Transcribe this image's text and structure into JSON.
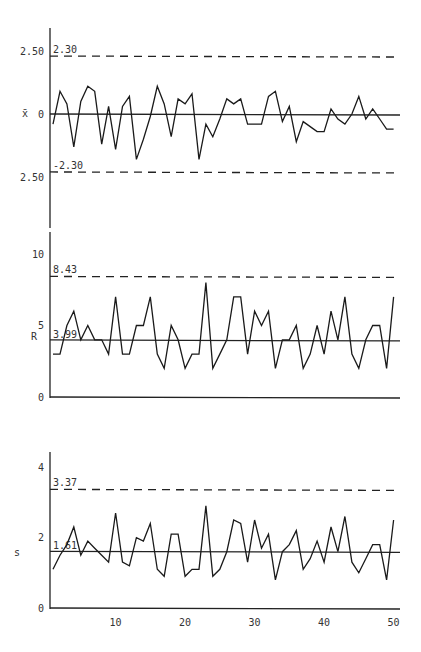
{
  "chart_data": [
    {
      "type": "line",
      "title": "",
      "ylabel": "x̄",
      "xlabel": "",
      "ytick_labels": [
        "2.50",
        "0",
        "2.50"
      ],
      "yticks": [
        2.5,
        0,
        -2.5
      ],
      "ylim": [
        -2.9,
        3.2
      ],
      "control_limits": {
        "ucl": 2.3,
        "center": 0,
        "lcl": -2.3
      },
      "ucl_label": "2.30",
      "lcl_label": "-2.30",
      "x": [
        1,
        2,
        3,
        4,
        5,
        6,
        7,
        8,
        9,
        10,
        11,
        12,
        13,
        14,
        15,
        16,
        17,
        18,
        19,
        20,
        21,
        22,
        23,
        24,
        25,
        26,
        27,
        28,
        29,
        30,
        31,
        32,
        33,
        34,
        35,
        36,
        37,
        38,
        39,
        40,
        41,
        42,
        43,
        44,
        45,
        46,
        47,
        48,
        49,
        50
      ],
      "values": [
        -0.4,
        0.9,
        0.4,
        -1.3,
        0.5,
        1.1,
        0.9,
        -1.2,
        0.3,
        -1.4,
        0.3,
        0.7,
        -1.8,
        -1.0,
        -0.1,
        1.1,
        0.4,
        -0.9,
        0.6,
        0.4,
        0.8,
        -1.8,
        -0.4,
        -0.9,
        -0.2,
        0.6,
        0.4,
        0.6,
        -0.4,
        -0.4,
        -0.4,
        0.7,
        0.9,
        -0.3,
        0.3,
        -1.1,
        -0.3,
        -0.5,
        -0.7,
        -0.7,
        0.2,
        -0.2,
        -0.4,
        0.0,
        0.7,
        -0.2,
        0.2,
        -0.2,
        -0.6,
        -0.6
      ],
      "grid": false
    },
    {
      "type": "line",
      "title": "",
      "ylabel": "R",
      "xlabel": "",
      "ytick_labels": [
        "10",
        "5",
        "0"
      ],
      "yticks": [
        10,
        5,
        0
      ],
      "ylim": [
        0,
        11
      ],
      "control_limits": {
        "ucl": 8.43,
        "center": 3.99
      },
      "ucl_label": "8.43",
      "center_label": "3.99",
      "x": [
        1,
        2,
        3,
        4,
        5,
        6,
        7,
        8,
        9,
        10,
        11,
        12,
        13,
        14,
        15,
        16,
        17,
        18,
        19,
        20,
        21,
        22,
        23,
        24,
        25,
        26,
        27,
        28,
        29,
        30,
        31,
        32,
        33,
        34,
        35,
        36,
        37,
        38,
        39,
        40,
        41,
        42,
        43,
        44,
        45,
        46,
        47,
        48,
        49,
        50
      ],
      "values": [
        3,
        3,
        5,
        6,
        4,
        5,
        4,
        4,
        3,
        7,
        3,
        3,
        5,
        5,
        7,
        3,
        2,
        5,
        4,
        2,
        3,
        3,
        8,
        2,
        3,
        4,
        7,
        7,
        3,
        6,
        5,
        6,
        2,
        4,
        4,
        5,
        2,
        3,
        5,
        3,
        6,
        4,
        7,
        3,
        2,
        4,
        5,
        5,
        2,
        7
      ],
      "grid": false
    },
    {
      "type": "line",
      "title": "",
      "ylabel": "s",
      "xlabel": "",
      "ytick_labels": [
        "4",
        "2",
        "0"
      ],
      "yticks": [
        4,
        2,
        0
      ],
      "ylim": [
        0,
        4.3
      ],
      "control_limits": {
        "ucl": 3.37,
        "center": 1.61
      },
      "ucl_label": "3.37",
      "center_label": "1.61",
      "x": [
        1,
        2,
        3,
        4,
        5,
        6,
        7,
        8,
        9,
        10,
        11,
        12,
        13,
        14,
        15,
        16,
        17,
        18,
        19,
        20,
        21,
        22,
        23,
        24,
        25,
        26,
        27,
        28,
        29,
        30,
        31,
        32,
        33,
        34,
        35,
        36,
        37,
        38,
        39,
        40,
        41,
        42,
        43,
        44,
        45,
        46,
        47,
        48,
        49,
        50
      ],
      "xtick_labels": [
        "10",
        "20",
        "30",
        "40",
        "50"
      ],
      "xticks": [
        10,
        20,
        30,
        40,
        50
      ],
      "values": [
        1.1,
        1.5,
        1.8,
        2.3,
        1.5,
        1.9,
        1.7,
        1.5,
        1.3,
        2.7,
        1.3,
        1.2,
        2.0,
        1.9,
        2.4,
        1.1,
        0.9,
        2.1,
        2.1,
        0.9,
        1.1,
        1.1,
        2.9,
        0.9,
        1.1,
        1.6,
        2.5,
        2.4,
        1.3,
        2.5,
        1.7,
        2.1,
        0.8,
        1.6,
        1.8,
        2.2,
        1.1,
        1.4,
        1.9,
        1.3,
        2.3,
        1.6,
        2.6,
        1.3,
        1.0,
        1.4,
        1.8,
        1.8,
        0.8,
        2.5
      ],
      "grid": false
    }
  ]
}
